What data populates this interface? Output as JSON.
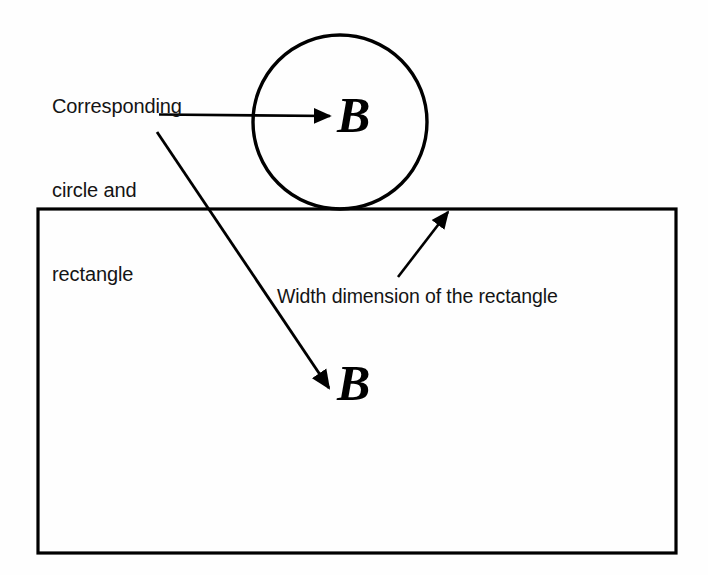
{
  "figure": {
    "background_color": "#fefefe",
    "stroke_color": "#000000",
    "text_color": "#141414"
  },
  "annotations": {
    "callout": {
      "line1": "Corresponding",
      "line2": "circle and",
      "line3": "rectangle"
    },
    "width_dimension": "Width dimension of the rectangle"
  },
  "labels": {
    "circle_letter": "B",
    "rectangle_letter": "B"
  },
  "shapes": {
    "circle": {
      "name": "circle",
      "center_x": 340,
      "center_y": 122,
      "radius": 87,
      "stroke_width": 3
    },
    "rectangle": {
      "name": "rectangle",
      "x": 38,
      "y": 209,
      "width": 638,
      "height": 344,
      "stroke_width": 3
    }
  },
  "leaders": {
    "callout_to_circle": {
      "x1": 159,
      "y1": 115,
      "x2": 333,
      "y2": 116,
      "arrowhead": "end"
    },
    "callout_to_rectangle": {
      "x1": 157,
      "y1": 132,
      "x2": 332,
      "y2": 392,
      "arrowhead": "end"
    },
    "width_to_edge": {
      "x1": 398,
      "y1": 277,
      "x2": 450,
      "y2": 210,
      "arrowhead": "end"
    }
  }
}
